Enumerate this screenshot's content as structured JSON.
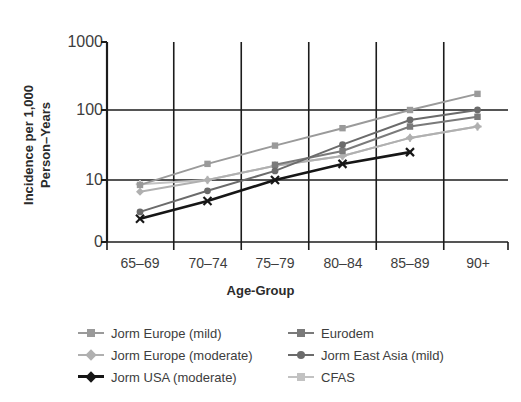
{
  "chart_data": {
    "type": "line",
    "title": "",
    "subtitle": "",
    "xlabel": "Age-Group",
    "ylabel": "Incidence per 1,000 Person–Years",
    "ylabel_line1": "Incidence per 1,000",
    "ylabel_line2": "Person–Years",
    "scale": "log",
    "categories": [
      "65–69",
      "70–74",
      "75–79",
      "80–84",
      "85–89",
      "90+"
    ],
    "yticks": [
      "1000",
      "100",
      "10",
      "0"
    ],
    "ytick_values": [
      1000,
      100,
      10,
      0
    ],
    "ylim": [
      1,
      1000
    ],
    "grid": "both",
    "legend_position": "below",
    "series": [
      {
        "name": "Jorm Europe (mild)",
        "color": "#9a9a9a",
        "marker": "square",
        "values": [
          8.5,
          17,
          31,
          55,
          100,
          170
        ]
      },
      {
        "name": "Jorm Europe (moderate)",
        "color": "#b0b0b0",
        "marker": "diamond",
        "values": [
          6.8,
          10,
          16,
          22,
          40,
          58
        ]
      },
      {
        "name": "Jorm USA (moderate)",
        "color": "#161616",
        "marker": "x",
        "values": [
          2.8,
          5.0,
          10,
          17,
          25,
          null
        ]
      },
      {
        "name": "Eurodem",
        "color": "#7a7a7a",
        "marker": "square",
        "values": [
          null,
          null,
          16.5,
          26,
          58,
          80
        ]
      },
      {
        "name": "Jorm East Asia (mild)",
        "color": "#6b6b6b",
        "marker": "circle",
        "values": [
          3.5,
          7.0,
          13.5,
          32,
          72,
          100
        ]
      },
      {
        "name": "CFAS",
        "color": "#c2c2c2",
        "marker": "plus",
        "values": [
          8.7,
          10,
          16,
          22,
          40,
          58
        ]
      }
    ]
  },
  "axis": {
    "y_title_line1": "Incidence per 1,000",
    "y_title_line2": "Person–Years",
    "x_title": "Age-Group",
    "y_tick_1000": "1000",
    "y_tick_100": "100",
    "y_tick_10": "10",
    "y_tick_0": "0",
    "x_tick_0": "65–69",
    "x_tick_1": "70–74",
    "x_tick_2": "75–79",
    "x_tick_3": "80–84",
    "x_tick_4": "85–89",
    "x_tick_5": "90+"
  },
  "legend": {
    "left": [
      {
        "label": "Jorm Europe (mild)",
        "color": "#9a9a9a",
        "marker": "square"
      },
      {
        "label": "Jorm Europe (moderate)",
        "color": "#b0b0b0",
        "marker": "diamond"
      },
      {
        "label": "Jorm USA (moderate)",
        "color": "#161616",
        "marker": "x"
      }
    ],
    "right": [
      {
        "label": "Eurodem",
        "color": "#7a7a7a",
        "marker": "square"
      },
      {
        "label": "Jorm East Asia (mild)",
        "color": "#6b6b6b",
        "marker": "circle"
      },
      {
        "label": "CFAS",
        "color": "#c2c2c2",
        "marker": "plus"
      }
    ]
  },
  "colors": {
    "axis": "#1c1c1c",
    "grid": "#1c1c1c",
    "text": "#3d3d3d",
    "background": "#ffffff"
  }
}
